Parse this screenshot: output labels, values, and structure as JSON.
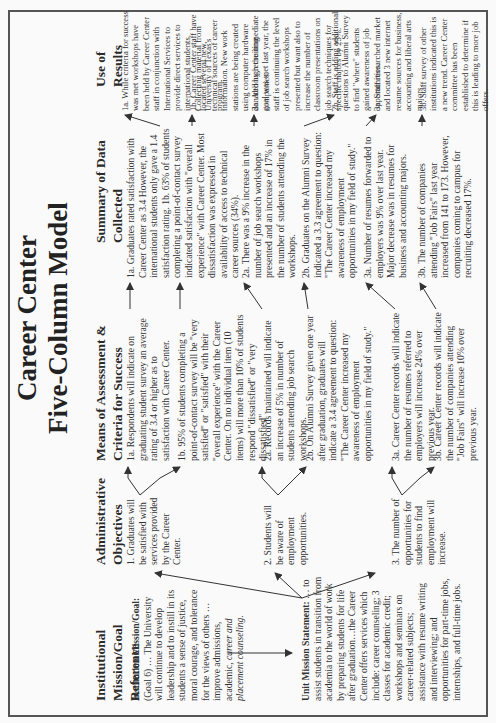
{
  "title": {
    "line1": "Career Center",
    "line2": "Five-Column Model"
  },
  "columns": [
    {
      "id": "institutional",
      "header": "Institutional Mission/Goal Reference"
    },
    {
      "id": "objectives",
      "header": "Administrative Objectives"
    },
    {
      "id": "means",
      "header": "Means of Assessment & Criteria for Success"
    },
    {
      "id": "summary",
      "header": "Summary of Data Collected"
    },
    {
      "id": "use",
      "header": "Use of Results"
    }
  ],
  "institutional": {
    "mission_label": "Institution Mission/Goal:",
    "mission_text": "(Goal 6) … The University will continue to develop leadership and to instill in its students a sense of justice, moral courage, and tolerance for the views of others …improve admissions, academic,",
    "mission_italic": "career and placement counseling.",
    "unit_label": "Unit Mission Statement:",
    "unit_text": "… to assist students in transition from academia to the world of work by preparing students for life after graduation…the Career Center offers services which include: career counseling; 3 classes for academic credit; workshops and seminars on career-related subjects; assistance with resume writing and interviewing; and opportunities for part-time jobs, internships, and full-time jobs."
  },
  "objectives": [
    "1. Graduates will be satisfied with services provided by the Career Center.",
    "2. Students will be aware of employment opportunities.",
    "3. The number of opportunities for students to find employment will increase."
  ],
  "means": [
    "1a. Respondents will indicate on graduating student survey an average rating of 3.4 or higher as to satisfaction with Career Center.",
    "1b. 95% of students completing a point-of-contact survey will be \"very satisfied\" or \"satisfied\" with their \"overall experience\" with the Career Center. On no individual item (10 items) will more than 10% of students respond \"dissatisfied\" or \"very dissatisfied\".",
    "2a. Records maintained will indicate an increase of 5% in number of students attending job search workshops.",
    "2b. On Alumni Survey given one year after graduation, graduates will indicate a 3.4 agreement to question: \"The Career Center increased my awareness of employment opportunities in my field of study.\"",
    "3a. Career Center records will indicate the number of resumes referred to employers will increase 24% over previous year.",
    "3b. Career Center records will indicate the number of companies attending \"Job Fairs\" will increase 10% over previous year."
  ],
  "summary": [
    "1a. Graduates rated satisfaction with Career Center as 3.4 However, the international students only gave a 1.4 satisfaction rating. 1b. 63% of students completing a point-of-contact survey indicated satisfaction with \"overall experience\" with Career Center. Most dissatisfaction was expressed in availability of access to technical career sources (34%).",
    "2a. There was a 9% increase in the number of job search workshops presented and an increase of 17% in the number of students attending the workshops.",
    "2b. Graduates on the Alumni Survey indicated a 3.3 agreement to question: \"The Career Center increased my awareness of employment opportunities in my field of study.\"",
    "3a. Number of resumes forwarded to employers was 9% over last year. Major decrease was in resumes for business and accounting majors.",
    "3b. The number of companies attending \"Job Fairs\" last year increased from 141 to 173. However, companies coming to campus for recruiting decreased 17%."
  ],
  "use": [
    "1a. While criteria for success was met workshops have been held by Career Center staff in conjunction with International Services to provide direct services to international students. Collecting material from University of Texas's program.",
    "1b. Career Center staff have located several new technical sources of career information. New work stations are being created using computer hardware donated by recruiting companies.",
    "2a. Although the immediate goal was met last year, the staff is continuing the level of job search workshops presented but want also to increase the number of classroom presentations on job search techniques for specific majors by 25%.",
    "2b. Staff is adding additional questions to Alumni Survey to find \"where\" students gained awareness of job opportunities.",
    "3a. Staff researched market and located 3 new internet resume sources for business, accounting and liberal arts majors.",
    "3b. Staff survey of other institutions indicated this is a new trend. Career Center committee has been established to determine if this is leading to more job offers."
  ]
}
